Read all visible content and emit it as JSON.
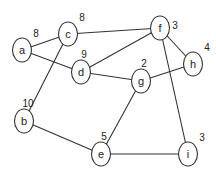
{
  "diagram": {
    "type": "weighted-graph",
    "nodes": [
      {
        "id": "a",
        "label": "a",
        "weight": "8"
      },
      {
        "id": "b",
        "label": "b",
        "weight": "10"
      },
      {
        "id": "c",
        "label": "c",
        "weight": "8"
      },
      {
        "id": "d",
        "label": "d",
        "weight": "9"
      },
      {
        "id": "e",
        "label": "e",
        "weight": "5"
      },
      {
        "id": "f",
        "label": "f",
        "weight": "3"
      },
      {
        "id": "g",
        "label": "g",
        "weight": "2"
      },
      {
        "id": "h",
        "label": "h",
        "weight": "4"
      },
      {
        "id": "i",
        "label": "i",
        "weight": "3"
      }
    ],
    "edges": [
      [
        "a",
        "c"
      ],
      [
        "a",
        "d"
      ],
      [
        "c",
        "f"
      ],
      [
        "c",
        "b"
      ],
      [
        "d",
        "f"
      ],
      [
        "d",
        "g"
      ],
      [
        "f",
        "h"
      ],
      [
        "f",
        "i"
      ],
      [
        "h",
        "g"
      ],
      [
        "g",
        "e"
      ],
      [
        "b",
        "e"
      ],
      [
        "e",
        "i"
      ]
    ]
  }
}
